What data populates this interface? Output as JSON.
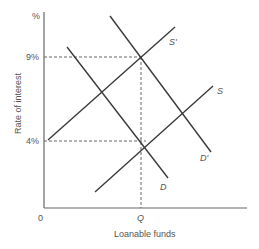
{
  "diagram": {
    "title": "",
    "y_axis": {
      "label": "Rate of interest",
      "unit_label": "%"
    },
    "x_axis": {
      "label": "Loanable funds",
      "origin_label": "0"
    },
    "y_ticks": [
      {
        "label": "9%",
        "value": 9
      },
      {
        "label": "4%",
        "value": 4
      }
    ],
    "x_ticks": [
      {
        "label": "Q"
      }
    ],
    "curves": [
      {
        "name": "S",
        "label": "S",
        "type": "supply"
      },
      {
        "name": "S'",
        "label": "S'",
        "type": "supply (shifted)"
      },
      {
        "name": "D",
        "label": "D",
        "type": "demand"
      },
      {
        "name": "D'",
        "label": "D'",
        "type": "demand (shifted)"
      }
    ],
    "equilibria": [
      {
        "curves": [
          "S",
          "D"
        ],
        "rate": "4%",
        "quantity": "Q"
      },
      {
        "curves": [
          "S'",
          "D'"
        ],
        "rate": "9%",
        "quantity": "Q"
      }
    ],
    "colors": {
      "line": "#3a3a3a",
      "axis": "#555555",
      "dashed": "#666666",
      "text": "#555555"
    }
  }
}
